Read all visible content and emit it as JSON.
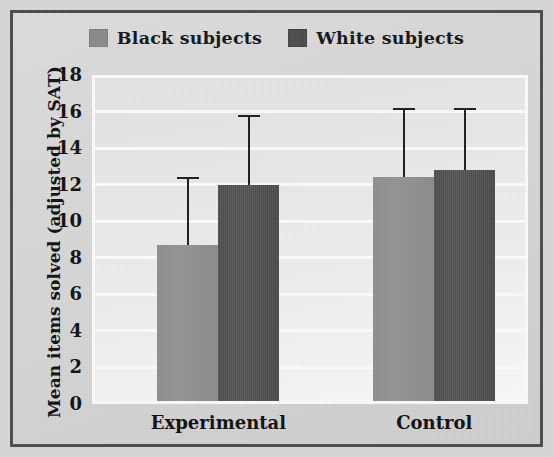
{
  "figure": {
    "background_color": "#d8d8d8",
    "frame_color": "#4b4b4b"
  },
  "legend": {
    "position": "top-center",
    "entries": [
      {
        "label": "Black subjects",
        "color": "#8a8a8a",
        "swatch": "legend-swatch-black-subjects"
      },
      {
        "label": "White subjects",
        "color": "#4a4a4a",
        "swatch": "legend-swatch-white-subjects"
      }
    ]
  },
  "axes": {
    "y_title": "Mean items solved (adjusted by SAT)",
    "x_title": "",
    "y_ticks": [
      "18",
      "16",
      "14",
      "12",
      "10",
      "8",
      "6",
      "4",
      "2",
      "0"
    ],
    "x_categories": [
      "Experimental",
      "Control"
    ]
  },
  "chart_data": {
    "type": "bar",
    "title": "",
    "subtitle": "",
    "xlabel": "",
    "ylabel": "Mean items solved (adjusted by SAT)",
    "categories": [
      "Experimental",
      "Control"
    ],
    "ylim": [
      0,
      18
    ],
    "ytick_step": 2,
    "yticks": [
      0,
      2,
      4,
      6,
      8,
      10,
      12,
      14,
      16,
      18
    ],
    "grid": true,
    "grid_axis": "y",
    "legend_position": "top-center",
    "error_bar_style": "upper-only-with-cap",
    "series": [
      {
        "name": "Black subjects",
        "color": "#8a8a8a",
        "values": [
          8.7,
          12.4
        ],
        "error_upper": [
          12.4,
          16.2
        ]
      },
      {
        "name": "White subjects",
        "color": "#4a4a4a",
        "values": [
          12.0,
          12.8
        ],
        "error_upper": [
          15.8,
          16.2
        ]
      }
    ]
  }
}
